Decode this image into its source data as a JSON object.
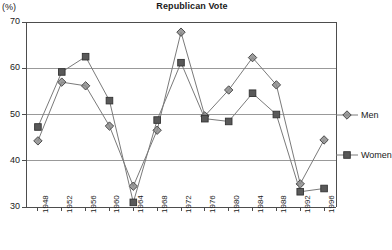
{
  "chart_data": {
    "type": "line",
    "title": "Republican Vote",
    "ylabel": "(%)",
    "xlabel": "",
    "ylim": [
      30,
      70
    ],
    "yticks": [
      30,
      40,
      50,
      60,
      70
    ],
    "ytick_labels": [
      "30",
      "40",
      "50",
      "60",
      "70"
    ],
    "grid": true,
    "legend_position": "right",
    "categories": [
      "1948",
      "1952",
      "1956",
      "1960",
      "1964",
      "1968",
      "1972",
      "1976",
      "1980",
      "1984",
      "1988",
      "1992",
      "1996"
    ],
    "series": [
      {
        "name": "Men",
        "marker": "diamond",
        "color": "#8c8c8c",
        "values": [
          44.3,
          57.0,
          56.2,
          47.5,
          34.5,
          46.6,
          67.8,
          49.7,
          55.3,
          62.3,
          56.4,
          35.0,
          44.5
        ]
      },
      {
        "name": "Women",
        "marker": "square",
        "color": "#595959",
        "values": [
          47.3,
          59.2,
          62.5,
          53.0,
          31.0,
          48.8,
          61.2,
          49.1,
          48.5,
          54.6,
          50.0,
          33.3,
          34.0
        ]
      }
    ]
  },
  "legend": {
    "items": [
      {
        "label": "Men"
      },
      {
        "label": "Women"
      }
    ]
  },
  "colors": {
    "axis": "#4d4d4d",
    "grid": "#999999",
    "men": "#8c8c8c",
    "women": "#595959",
    "text": "#1a1a1a"
  }
}
